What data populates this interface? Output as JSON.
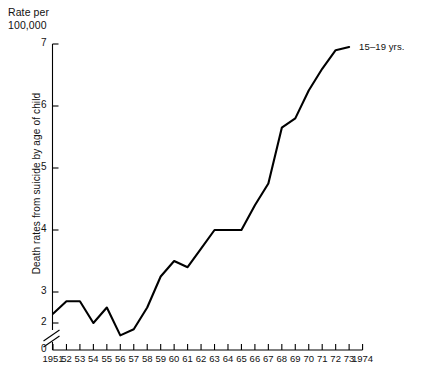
{
  "figure": {
    "unit_caption": "Rate per\n100,000",
    "ylabel": "Death rates from suicide by age of child",
    "series_label": "15–19 yrs."
  },
  "chart_data": {
    "type": "line",
    "title": "",
    "subtitle": "",
    "xlabel": "",
    "ylabel": "Death rates from suicide by age of child",
    "unit_caption": "Rate per 100,000",
    "grid": false,
    "legend_position": "right-inline",
    "axis_break_y": true,
    "axis_break_between": [
      0,
      2
    ],
    "xlim": [
      1951,
      1974
    ],
    "ylim": [
      2,
      7
    ],
    "yticks": [
      0,
      2,
      3,
      4,
      5,
      6,
      7
    ],
    "ytick_labels": [
      "0",
      "2",
      "3",
      "4",
      "5",
      "6",
      "7"
    ],
    "xticks": [
      1951,
      1952,
      1953,
      1954,
      1955,
      1956,
      1957,
      1958,
      1959,
      1960,
      1961,
      1962,
      1963,
      1964,
      1965,
      1966,
      1967,
      1968,
      1969,
      1970,
      1971,
      1972,
      1973,
      1974
    ],
    "xtick_labels": [
      "1951",
      "52",
      "53",
      "54",
      "55",
      "56",
      "57",
      "58",
      "59",
      "60",
      "61",
      "62",
      "63",
      "64",
      "65",
      "66",
      "67",
      "68",
      "69",
      "70",
      "71",
      "72",
      "73",
      "1974"
    ],
    "series": [
      {
        "name": "15–19 yrs.",
        "color": "#000000",
        "x": [
          1951,
          1952,
          1953,
          1954,
          1955,
          1956,
          1957,
          1958,
          1959,
          1960,
          1961,
          1962,
          1963,
          1964,
          1965,
          1966,
          1967,
          1968,
          1969,
          1970,
          1971,
          1972,
          1973
        ],
        "values": [
          2.65,
          2.85,
          2.85,
          2.5,
          2.75,
          2.3,
          2.4,
          2.75,
          3.25,
          3.5,
          3.4,
          3.7,
          4.0,
          4.0,
          4.0,
          4.4,
          4.75,
          5.65,
          5.8,
          6.25,
          6.6,
          6.9,
          6.95
        ]
      }
    ]
  }
}
